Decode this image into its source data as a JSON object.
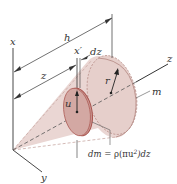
{
  "diagram": {
    "title": "",
    "type": "cone with differential disk element",
    "colors": {
      "cone_fill": "#ead6d3",
      "cone_shade": "#d9bab6",
      "disk_fill": "#c99893",
      "disk_edge": "#a8524c",
      "line": "#333333",
      "background": "#ffffff"
    },
    "labels": {
      "x_axis": "x",
      "y_axis": "y",
      "z_axis": "z",
      "x_prime": "x′",
      "height": "h",
      "distance": "z",
      "thickness": "dz",
      "radius": "r",
      "disk_radius": "u",
      "mass": "m"
    },
    "equation": "dm = ρ(πu²) dz",
    "equation_parts": {
      "lhs": "dm",
      "eq": " = ρ(πu",
      "sup": "2",
      "rhs": ")dz"
    }
  }
}
